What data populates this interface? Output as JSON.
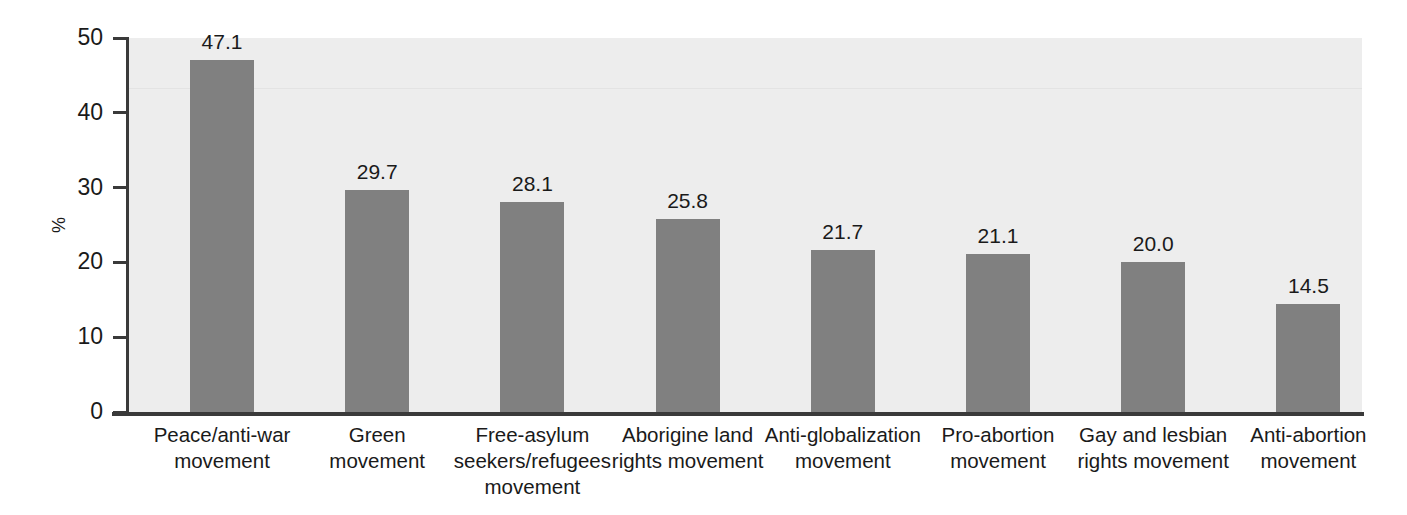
{
  "chart_data": {
    "type": "bar",
    "title": "",
    "xlabel": "",
    "ylabel": "%",
    "ylim": [
      0,
      50
    ],
    "yticks": [
      0,
      10,
      20,
      30,
      40,
      50
    ],
    "grid": false,
    "legend": null,
    "bar_color": "#808080",
    "plot_background": "#ededed",
    "categories": [
      "Peace/anti-war movement",
      "Green movement",
      "Free-asylum seekers/refugees movement",
      "Aborigine land rights movement",
      "Anti-globalization movement",
      "Pro-abortion movement",
      "Gay and lesbian rights movement",
      "Anti-abortion movement"
    ],
    "category_lines": [
      [
        "Peace/anti-war",
        "movement"
      ],
      [
        "Green",
        "movement"
      ],
      [
        "Free-asylum",
        "seekers/refugees",
        "movement"
      ],
      [
        "Aborigine land",
        "rights movement"
      ],
      [
        "Anti-globalization",
        "movement"
      ],
      [
        "Pro-abortion",
        "movement"
      ],
      [
        "Gay and lesbian",
        "rights movement"
      ],
      [
        "Anti-abortion",
        "movement"
      ]
    ],
    "values": [
      47.1,
      29.7,
      28.1,
      25.8,
      21.7,
      21.1,
      20.0,
      14.5
    ],
    "value_labels": [
      "47.1",
      "29.7",
      "28.1",
      "25.8",
      "21.7",
      "21.1",
      "20.0",
      "14.5"
    ]
  },
  "axis": {
    "y_tick_labels": [
      "50",
      "40",
      "30",
      "20",
      "10",
      "0"
    ],
    "y_title": "%"
  }
}
